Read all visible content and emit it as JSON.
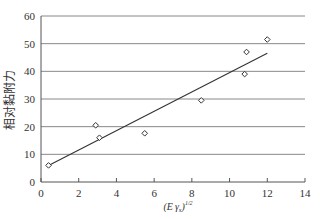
{
  "chart_data": {
    "type": "scatter",
    "title": "",
    "xlabel": "(E·γs)^1/2",
    "xlabel_parts": {
      "open": "(E",
      "gamma": "γ",
      "sub": "s",
      "close": ")",
      "sup": "1/2"
    },
    "ylabel": "相对黏附力",
    "xlim": [
      0,
      14
    ],
    "ylim": [
      0,
      60
    ],
    "xticks": [
      0,
      2,
      4,
      6,
      8,
      10,
      12,
      14
    ],
    "yticks": [
      0,
      10,
      20,
      30,
      40,
      50,
      60
    ],
    "grid": "horizontal",
    "legend": "none",
    "series": [
      {
        "name": "data",
        "marker": "diamond",
        "points": [
          {
            "x": 0.4,
            "y": 6.0
          },
          {
            "x": 2.9,
            "y": 20.5
          },
          {
            "x": 3.1,
            "y": 16.0
          },
          {
            "x": 5.5,
            "y": 17.6
          },
          {
            "x": 8.5,
            "y": 29.5
          },
          {
            "x": 10.8,
            "y": 39.0
          },
          {
            "x": 10.9,
            "y": 47.0
          },
          {
            "x": 12.0,
            "y": 51.5
          }
        ]
      }
    ],
    "trendline": {
      "type": "linear",
      "from": {
        "x": 0.4,
        "y": 6.0
      },
      "to": {
        "x": 12.0,
        "y": 46.5
      }
    }
  }
}
